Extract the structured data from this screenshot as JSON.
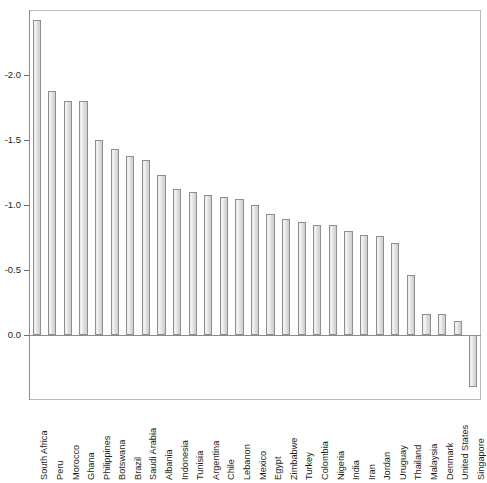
{
  "chart_data": {
    "type": "bar",
    "title": "Poor students' standard deviations from OECD",
    "xlabel": "",
    "ylabel": "",
    "orientation": "vertical",
    "grid": false,
    "legend": null,
    "ylim": [
      0.5,
      -2.5
    ],
    "y_axis_inverted": true,
    "y_ticks": [
      0.0,
      -0.5,
      -1.0,
      -1.5,
      -2.0
    ],
    "y_tick_labels": [
      "0.0",
      "-0.5",
      "-1.0",
      "-1.5",
      "-2.0"
    ],
    "categories": [
      "South Africa",
      "Peru",
      "Morocco",
      "Ghana",
      "Philippines",
      "Botswana",
      "Brazil",
      "Saudi Arabia",
      "Albania",
      "Indonesia",
      "Tunisia",
      "Argentina",
      "Chile",
      "Lebanon",
      "Mexico",
      "Egypt",
      "Zimbabwe",
      "Turkey",
      "Colombia",
      "Nigeria",
      "India",
      "Iran",
      "Jordan",
      "Uruguay",
      "Thailand",
      "Malaysia",
      "Denmark",
      "United States",
      "Singapore"
    ],
    "values": [
      -2.42,
      -1.88,
      -1.8,
      -1.8,
      -1.5,
      -1.43,
      -1.38,
      -1.35,
      -1.23,
      -1.12,
      -1.1,
      -1.08,
      -1.06,
      -1.05,
      -1.0,
      -0.93,
      -0.89,
      -0.87,
      -0.85,
      -0.85,
      -0.8,
      -0.77,
      -0.76,
      -0.71,
      -0.46,
      -0.16,
      -0.16,
      -0.11,
      0.4
    ],
    "bar_fill_color": "#e8e8e8",
    "bar_edge_color": "#8e8e8e",
    "axis_color": "#8c8c8c",
    "text_color": "#231f20"
  }
}
